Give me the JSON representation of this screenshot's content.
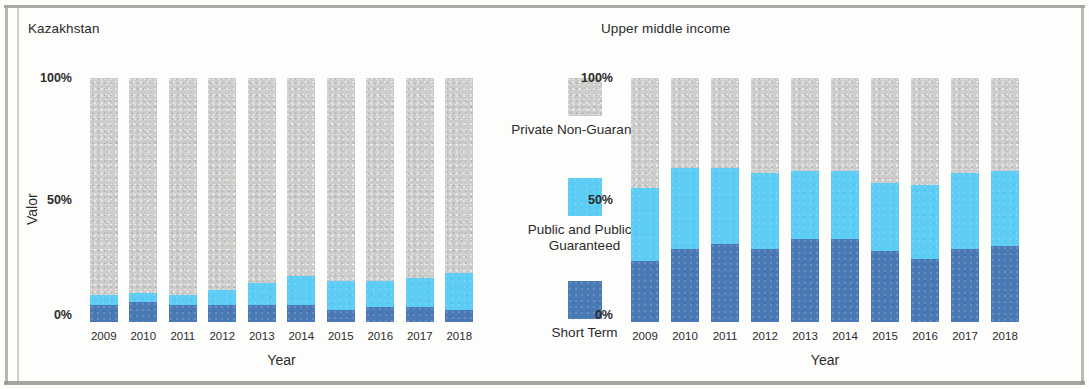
{
  "figure": {
    "panels": [
      {
        "title": "Kazakhstan",
        "ylabel": "Valor",
        "xlabel": "Year"
      },
      {
        "title": "Upper middle income",
        "ylabel": "Valor",
        "xlabel": "Year"
      }
    ],
    "ytick_labels": [
      "100%",
      "50%",
      "0%"
    ],
    "legend": {
      "items": [
        {
          "label": "Private Non-Guaranteed",
          "color": "#cdcdcb",
          "key": "private_non_guaranteed"
        },
        {
          "label": "Public and Publicly Guaranteed",
          "color": "#5ecdf5",
          "key": "public_and_publicly_guaranteed"
        },
        {
          "label": "Short Term",
          "color": "#4a7ab5",
          "key": "short_term"
        }
      ]
    }
  },
  "chart_data": [
    {
      "type": "bar",
      "stacked": true,
      "normalized": true,
      "title": "Kazakhstan",
      "xlabel": "Year",
      "ylabel": "Valor",
      "ylim": [
        0,
        100
      ],
      "yticks": [
        0,
        50,
        100
      ],
      "ytick_labels": [
        "0%",
        "50%",
        "100%"
      ],
      "grid": false,
      "legend_position": "center",
      "categories": [
        "2009",
        "2010",
        "2011",
        "2012",
        "2013",
        "2014",
        "2015",
        "2016",
        "2017",
        "2018"
      ],
      "series": [
        {
          "name": "Short Term",
          "color": "#4a7ab5",
          "values": [
            7,
            8,
            7,
            7,
            7,
            7,
            5,
            6,
            6,
            5
          ]
        },
        {
          "name": "Public and Publicly Guaranteed",
          "color": "#5ecdf5",
          "values": [
            4,
            4,
            4,
            6,
            9,
            12,
            12,
            11,
            12,
            15
          ]
        },
        {
          "name": "Private Non-Guaranteed",
          "color": "#cdcdcb",
          "values": [
            89,
            88,
            89,
            87,
            84,
            81,
            83,
            83,
            82,
            80
          ]
        }
      ]
    },
    {
      "type": "bar",
      "stacked": true,
      "normalized": true,
      "title": "Upper middle income",
      "xlabel": "Year",
      "ylabel": "Valor",
      "ylim": [
        0,
        100
      ],
      "yticks": [
        0,
        50,
        100
      ],
      "ytick_labels": [
        "0%",
        "50%",
        "100%"
      ],
      "grid": false,
      "legend_position": "center",
      "categories": [
        "2009",
        "2010",
        "2011",
        "2012",
        "2013",
        "2014",
        "2015",
        "2016",
        "2017",
        "2018"
      ],
      "series": [
        {
          "name": "Short Term",
          "color": "#4a7ab5",
          "values": [
            25,
            30,
            32,
            30,
            34,
            34,
            29,
            26,
            30,
            31
          ]
        },
        {
          "name": "Public and Publicly Guaranteed",
          "color": "#5ecdf5",
          "values": [
            30,
            33,
            31,
            31,
            28,
            28,
            28,
            30,
            31,
            31
          ]
        },
        {
          "name": "Private Non-Guaranteed",
          "color": "#cdcdcb",
          "values": [
            45,
            37,
            37,
            39,
            38,
            38,
            43,
            44,
            39,
            38
          ]
        }
      ]
    }
  ]
}
